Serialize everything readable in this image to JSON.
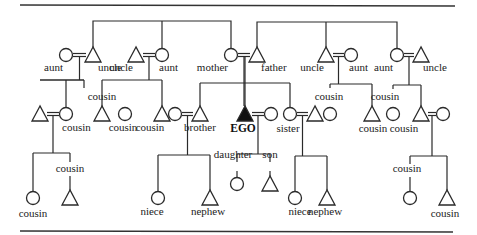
{
  "diagram": {
    "title": "",
    "legend": {
      "male": "triangle",
      "female": "circle",
      "ego": "filled triangle",
      "marriage": "double line (=)"
    },
    "people": [
      {
        "id": "g_aunt1",
        "sex": "female",
        "label": "aunt"
      },
      {
        "id": "g_uncle1",
        "sex": "male",
        "label": "uncle"
      },
      {
        "id": "g_uncle2",
        "sex": "male",
        "label": "uncle"
      },
      {
        "id": "g_aunt2",
        "sex": "female",
        "label": "aunt"
      },
      {
        "id": "mother",
        "sex": "female",
        "label": "mother"
      },
      {
        "id": "father",
        "sex": "male",
        "label": "father"
      },
      {
        "id": "g_uncle3",
        "sex": "male",
        "label": "uncle"
      },
      {
        "id": "g_aunt3",
        "sex": "female",
        "label": "aunt"
      },
      {
        "id": "g_aunt4",
        "sex": "female",
        "label": "aunt"
      },
      {
        "id": "g_uncle4",
        "sex": "male",
        "label": "uncle"
      },
      {
        "id": "c1_spouse",
        "sex": "male",
        "label": ""
      },
      {
        "id": "c1",
        "sex": "female",
        "label": "cousin"
      },
      {
        "id": "c2",
        "sex": "male",
        "label": "cousin"
      },
      {
        "id": "c3",
        "sex": "female",
        "label": "cousin"
      },
      {
        "id": "c4",
        "sex": "male",
        "label": "cousin"
      },
      {
        "id": "brother_wife",
        "sex": "female",
        "label": ""
      },
      {
        "id": "brother",
        "sex": "male",
        "label": "brother"
      },
      {
        "id": "ego",
        "sex": "male",
        "label": "EGO",
        "ego": true
      },
      {
        "id": "ego_wife",
        "sex": "female",
        "label": ""
      },
      {
        "id": "sister",
        "sex": "female",
        "label": "sister"
      },
      {
        "id": "sister_husband",
        "sex": "male",
        "label": ""
      },
      {
        "id": "c5",
        "sex": "female",
        "label": "cousin"
      },
      {
        "id": "c6",
        "sex": "male",
        "label": "cousin"
      },
      {
        "id": "c7",
        "sex": "female",
        "label": "cousin"
      },
      {
        "id": "c8",
        "sex": "male",
        "label": "cousin"
      },
      {
        "id": "c8_wife",
        "sex": "female",
        "label": ""
      },
      {
        "id": "c1_d",
        "sex": "female",
        "label": "cousin"
      },
      {
        "id": "c1_s",
        "sex": "male",
        "label": "cousin"
      },
      {
        "id": "niece1",
        "sex": "female",
        "label": "niece"
      },
      {
        "id": "nephew1",
        "sex": "male",
        "label": "nephew"
      },
      {
        "id": "daughter",
        "sex": "female",
        "label": "daughter"
      },
      {
        "id": "son",
        "sex": "male",
        "label": "son"
      },
      {
        "id": "niece2",
        "sex": "female",
        "label": "niece"
      },
      {
        "id": "nephew2",
        "sex": "male",
        "label": "nephew"
      },
      {
        "id": "c8_d",
        "sex": "female",
        "label": "cousin"
      },
      {
        "id": "c8_s",
        "sex": "male",
        "label": "cousin"
      }
    ]
  }
}
